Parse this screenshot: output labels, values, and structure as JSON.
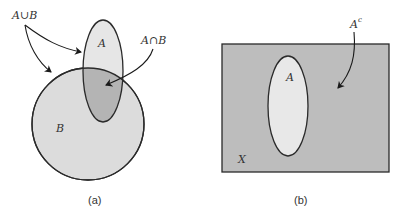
{
  "panel_a": {
    "caption": "(a)",
    "set_a_label": "A",
    "set_b_label": "B",
    "union_label": "A∪B",
    "intersection_label": "A∩B",
    "colors": {
      "only_a": "#e6e6e6",
      "only_b": "#dcdcdc",
      "intersection": "#b4b4b4",
      "stroke": "#2a2a2a"
    }
  },
  "panel_b": {
    "caption": "(b)",
    "set_a_label": "A",
    "universe_label": "X",
    "complement_label": "A",
    "complement_sup": "c",
    "colors": {
      "universe_fill": "#bdbdbd",
      "set_a_fill": "#e8e8e8",
      "stroke": "#2a2a2a"
    }
  }
}
